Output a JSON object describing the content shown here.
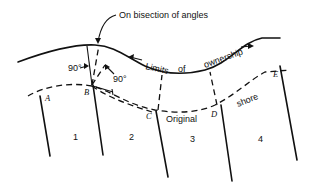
{
  "diagram": {
    "annotations": {
      "bisection": "On bisection of angles",
      "limits_1": "Limits",
      "limits_2": "of",
      "limits_3": "ownership",
      "original": "Original",
      "shore": "shore",
      "angle_left": "90°",
      "angle_right": "90°"
    },
    "points": {
      "A": "A",
      "B": "B",
      "C": "C",
      "D": "D",
      "E": "E"
    },
    "lots": [
      "1",
      "2",
      "3",
      "4"
    ],
    "colors": {
      "ink": "#111111",
      "background": "#ffffff"
    }
  }
}
